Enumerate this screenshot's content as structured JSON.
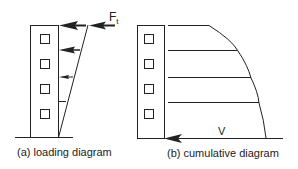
{
  "figure": {
    "panel_a": {
      "caption": "(a) loading diagram",
      "force_label": "F",
      "force_subscript": "t",
      "windows": 4
    },
    "panel_b": {
      "caption": "(b) cumulative diagram",
      "base_label": "V",
      "windows": 4
    }
  },
  "colors": {
    "stroke": "#222222",
    "background": "#ffffff"
  }
}
